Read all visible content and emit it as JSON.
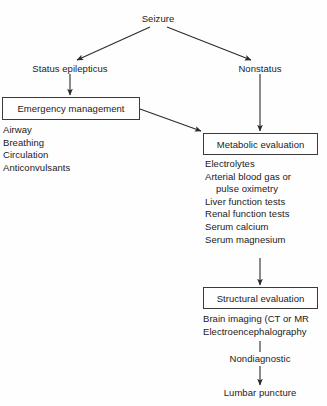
{
  "diagram": {
    "background_color": "#fefefe",
    "line_color": "#3a3a3a",
    "text_color": "#1a1a1a",
    "nodes": {
      "seizure": "Seizure",
      "status_epilepticus": "Status epilepticus",
      "nonstatus": "Nonstatus",
      "emergency_management": "Emergency management",
      "metabolic_evaluation": "Metabolic evaluation",
      "structural_evaluation": "Structural evaluation",
      "nondiagnostic": "Nondiagnostic",
      "lumbar_puncture": "Lumbar puncture"
    },
    "emergency_list": [
      "Airway",
      "Breathing",
      "Circulation",
      "Anticonvulsants"
    ],
    "metabolic_list": [
      "Electrolytes",
      "Arterial blood gas or",
      "pulse oximetry",
      "Liver function tests",
      "Renal function tests",
      "Serum calcium",
      "Serum magnesium"
    ],
    "structural_list": [
      "Brain imaging (CT or MR",
      "Electroencephalography"
    ]
  }
}
